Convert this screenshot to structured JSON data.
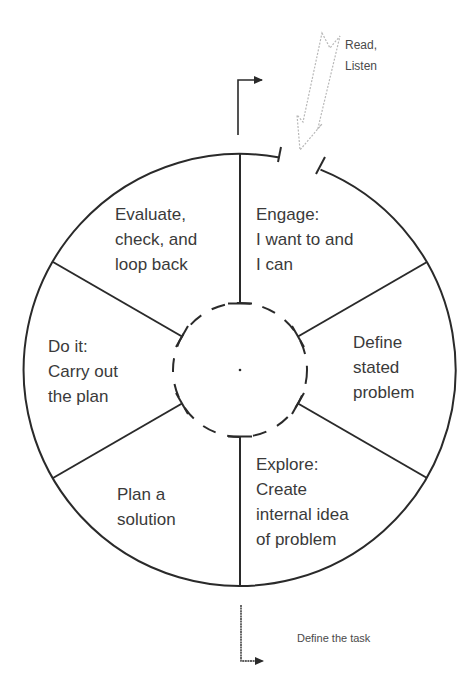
{
  "diagram": {
    "colors": {
      "line": "#2a2a2a",
      "text": "#3a3a3a",
      "input_arrow": "#b8b8b8",
      "background": "#ffffff"
    },
    "center": {
      "x": 240,
      "y": 370
    },
    "outer_radius": 216,
    "inner_radius": 67,
    "segments": [
      {
        "id": "engage",
        "lines": [
          "Engage:",
          "I want to and",
          "I can"
        ]
      },
      {
        "id": "define",
        "lines": [
          "Define",
          "stated",
          "problem"
        ]
      },
      {
        "id": "explore",
        "lines": [
          "Explore:",
          "Create",
          "internal idea",
          "of problem"
        ]
      },
      {
        "id": "plan",
        "lines": [
          "Plan a",
          "solution"
        ]
      },
      {
        "id": "do",
        "lines": [
          "Do it:",
          "Carry out",
          "the plan"
        ]
      },
      {
        "id": "evaluate",
        "lines": [
          "Evaluate,",
          "check, and",
          "loop back"
        ]
      }
    ],
    "input_arrow": {
      "label_lines": [
        "Read,",
        "Listen"
      ]
    },
    "exit_arrow_top": {
      "direction": "right"
    },
    "exit_arrow_bottom": {
      "label": "Define the task",
      "direction": "right"
    }
  }
}
